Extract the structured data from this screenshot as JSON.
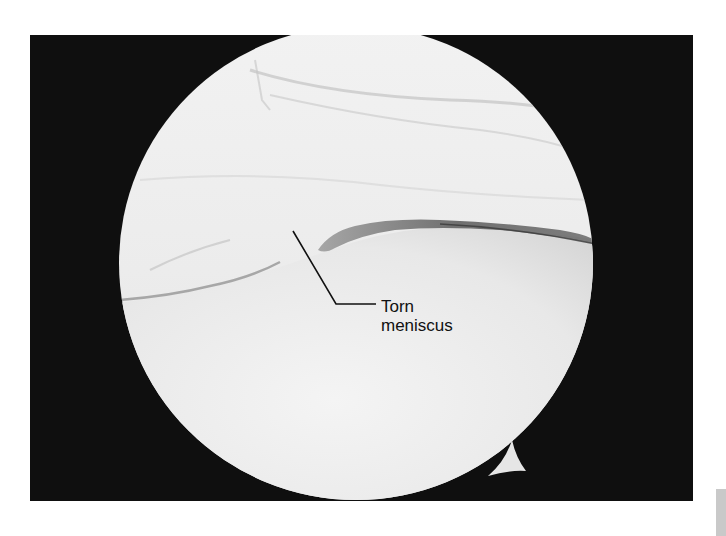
{
  "figure": {
    "type": "arthroscopic-photograph",
    "background_color": "#ffffff",
    "frame_color": "#0f0f0f",
    "view_fill_color": "#eeeeee",
    "annotation": {
      "line1": "Torn",
      "line2": "meniscus",
      "pointer_color": "#111111"
    }
  }
}
